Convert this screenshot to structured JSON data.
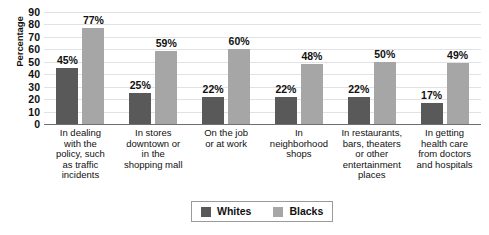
{
  "chart_data": {
    "type": "bar",
    "title": "",
    "xlabel": "",
    "ylabel": "Percentage",
    "ylim": [
      0,
      90
    ],
    "ytick_step": 10,
    "yticks": [
      90,
      80,
      70,
      60,
      50,
      40,
      30,
      20,
      10,
      0
    ],
    "grid": true,
    "legend_position": "bottom-center",
    "value_label_suffix": "%",
    "categories": [
      "In dealing with the policy, such as traffic incidents",
      "In stores downtown or in the shopping mall",
      "On the job or at work",
      "In neighborhood shops",
      "In restaurants, bars, theaters or other entertainment places",
      "In getting health care from doctors and hospitals"
    ],
    "category_lines": [
      [
        "In dealing",
        "with the",
        "policy, such",
        "as traffic",
        "incidents"
      ],
      [
        "In stores",
        "downtown or",
        "in the",
        "shopping mall"
      ],
      [
        "On the job",
        "or at work"
      ],
      [
        "In",
        "neighborhood",
        "shops"
      ],
      [
        "In restaurants,",
        "bars, theaters",
        "or other",
        "entertainment",
        "places"
      ],
      [
        "In getting",
        "health care",
        "from doctors",
        "and hospitals"
      ]
    ],
    "series": [
      {
        "name": "Whites",
        "color": "#595959",
        "values": [
          45,
          25,
          22,
          22,
          22,
          17
        ],
        "value_labels": [
          "45%",
          "25%",
          "22%",
          "22%",
          "22%",
          "17%"
        ]
      },
      {
        "name": "Blacks",
        "color": "#a6a6a6",
        "values": [
          77,
          59,
          60,
          48,
          50,
          49
        ],
        "value_labels": [
          "77%",
          "59%",
          "60%",
          "48%",
          "50%",
          "49%"
        ]
      }
    ]
  }
}
